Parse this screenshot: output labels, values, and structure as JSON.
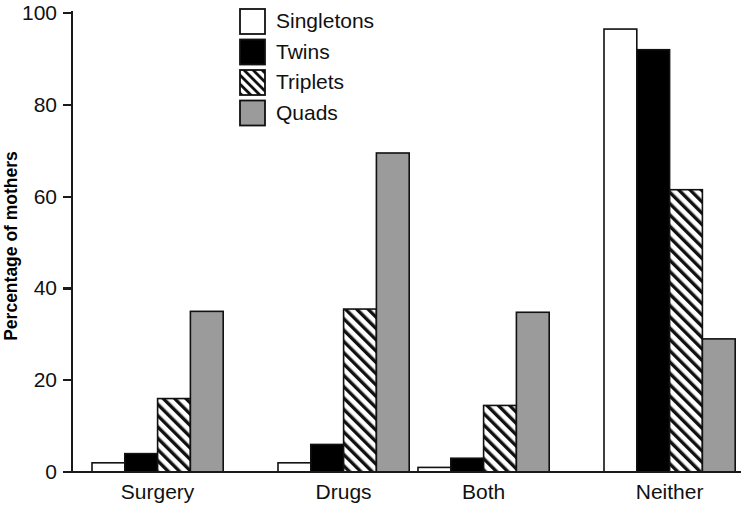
{
  "chart_data": {
    "type": "bar",
    "title": "",
    "subtitle": "",
    "xlabel": "",
    "ylabel": "Percentage of mothers",
    "categories": [
      "Surgery",
      "Drugs",
      "Both",
      "Neither"
    ],
    "series": [
      {
        "name": "Singletons",
        "values": [
          2,
          2,
          1,
          96.5
        ],
        "fill": "#ffffff",
        "pattern": "solid"
      },
      {
        "name": "Twins",
        "values": [
          4,
          6,
          3,
          92
        ],
        "fill": "#000000",
        "pattern": "solid"
      },
      {
        "name": "Triplets",
        "values": [
          16,
          35.5,
          14.5,
          61.5
        ],
        "fill": "#ffffff",
        "pattern": "diagonal-hatch"
      },
      {
        "name": "Quads",
        "values": [
          35,
          69.5,
          34.8,
          29
        ],
        "fill": "#9b9b9b",
        "pattern": "solid"
      }
    ],
    "ylim": [
      0,
      100
    ],
    "yticks": [
      0,
      20,
      40,
      60,
      80,
      100
    ],
    "ytick_labels": [
      "0",
      "20",
      "40",
      "60",
      "80",
      "100"
    ],
    "grid": false,
    "legend_position": "top-center",
    "legend_entries": [
      "Singletons",
      "Twins",
      "Triplets",
      "Quads"
    ],
    "axis_color": "#1a1a1a",
    "background_color": "#ffffff"
  },
  "legend": {
    "items": [
      {
        "label": "Singletons"
      },
      {
        "label": "Twins"
      },
      {
        "label": "Triplets"
      },
      {
        "label": "Quads"
      }
    ]
  }
}
